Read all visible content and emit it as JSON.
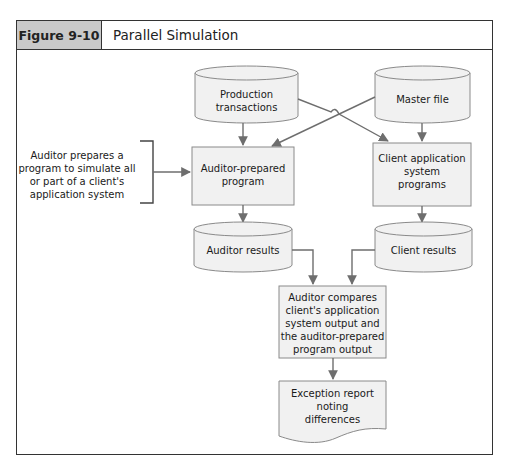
{
  "figure": {
    "label": "Figure 9-10",
    "title": "Parallel Simulation",
    "label_bg": "#c9c9c9",
    "shape_fill": "#f1f1f1"
  },
  "diagram": {
    "nodes": {
      "production": {
        "type": "cylinder",
        "lines": [
          "Production",
          "transactions"
        ]
      },
      "master": {
        "type": "cylinder",
        "lines": [
          "Master file"
        ]
      },
      "auditor_program": {
        "type": "process",
        "lines": [
          "Auditor-prepared",
          "program"
        ]
      },
      "client_programs": {
        "type": "process",
        "lines": [
          "Client application",
          "system",
          "programs"
        ]
      },
      "auditor_results": {
        "type": "cylinder",
        "lines": [
          "Auditor results"
        ]
      },
      "client_results": {
        "type": "cylinder",
        "lines": [
          "Client results"
        ]
      },
      "compare": {
        "type": "process",
        "lines": [
          "Auditor compares",
          "client's application",
          "system output and",
          "the auditor-prepared",
          "program output"
        ]
      },
      "report": {
        "type": "document",
        "lines": [
          "Exception report",
          "noting",
          "differences"
        ]
      }
    },
    "annotation": {
      "lines": [
        "Auditor prepares a",
        "program to simulate all",
        "or part of a client's",
        "application system"
      ]
    },
    "edges": [
      {
        "from": "production",
        "to": "auditor_program"
      },
      {
        "from": "production",
        "to": "client_programs"
      },
      {
        "from": "master",
        "to": "client_programs"
      },
      {
        "from": "master",
        "to": "auditor_program"
      },
      {
        "from": "annotation",
        "to": "auditor_program"
      },
      {
        "from": "auditor_program",
        "to": "auditor_results"
      },
      {
        "from": "client_programs",
        "to": "client_results"
      },
      {
        "from": "auditor_results",
        "to": "compare"
      },
      {
        "from": "client_results",
        "to": "compare"
      },
      {
        "from": "compare",
        "to": "report"
      }
    ]
  }
}
